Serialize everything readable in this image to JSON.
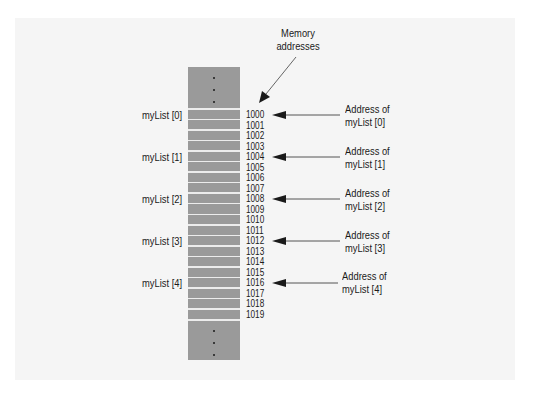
{
  "diagram": {
    "header_label_line1": "Memory",
    "header_label_line2": "addresses",
    "addresses": [
      "1000",
      "1001",
      "1002",
      "1003",
      "1004",
      "1005",
      "1006",
      "1007",
      "1008",
      "1009",
      "1010",
      "1011",
      "1012",
      "1013",
      "1014",
      "1015",
      "1016",
      "1017",
      "1018",
      "1019"
    ],
    "elements": [
      {
        "label": "myList [0]",
        "address": "1000",
        "annotation_line1": "Address of",
        "annotation_line2": "myList [0]"
      },
      {
        "label": "myList [1]",
        "address": "1004",
        "annotation_line1": "Address of",
        "annotation_line2": "myList [1]"
      },
      {
        "label": "myList [2]",
        "address": "1008",
        "annotation_line1": "Address of",
        "annotation_line2": "myList [2]"
      },
      {
        "label": "myList [3]",
        "address": "1012",
        "annotation_line1": "Address of",
        "annotation_line2": "myList [3]"
      },
      {
        "label": "myList [4]",
        "address": "1016",
        "annotation_line1": "Address of",
        "annotation_line2": "myList [4]"
      }
    ],
    "colors": {
      "panel": "#f5f5f5",
      "memory_column": "#9a9a9a",
      "row_divider": "#ececec",
      "arrow": "#1a1a1a"
    }
  }
}
